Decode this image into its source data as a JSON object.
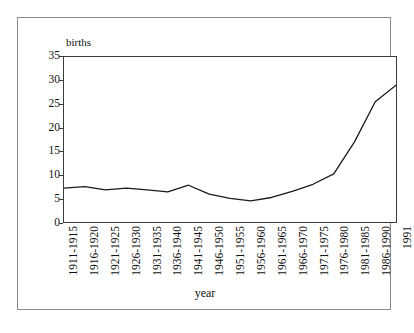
{
  "chart_data": {
    "type": "line",
    "title": "",
    "xlabel": "year",
    "ylabel": "births",
    "categories": [
      "1911-1915",
      "1916-1920",
      "1921-1925",
      "1926-1930",
      "1931-1935",
      "1936-1940",
      "1941-1945",
      "1946-1950",
      "1951-1955",
      "1956-1960",
      "1961-1965",
      "1966-1970",
      "1971-1975",
      "1976-1980",
      "1981-1985",
      "1986-1990",
      "1991"
    ],
    "values": [
      7.2,
      7.5,
      6.8,
      7.2,
      6.8,
      6.4,
      7.8,
      5.9,
      5.0,
      4.5,
      5.2,
      6.5,
      8.0,
      10.2,
      17.0,
      25.5,
      29.0
    ],
    "ylim": [
      0,
      35
    ],
    "yticks": [
      0,
      5,
      10,
      15,
      20,
      25,
      30,
      35
    ],
    "grid": false,
    "legend": false,
    "line_color": "#1a1a1a"
  },
  "axes": {
    "y_title": "births",
    "x_title": "year"
  }
}
